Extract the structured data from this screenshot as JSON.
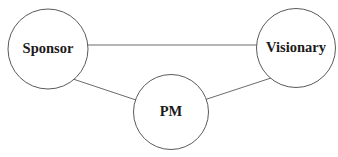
{
  "diagram": {
    "background_color": "#ffffff",
    "node_fill_color": "#ffffff",
    "node_stroke_color": "#5a5a5a",
    "edge_color": "#6b6b6b",
    "label_color": "#1a1a1a",
    "nodes": [
      {
        "id": "sponsor",
        "label": "Sponsor",
        "cx": 48,
        "cy": 49,
        "r": 40,
        "font_size": 14.5
      },
      {
        "id": "visionary",
        "label": "Visionary",
        "cx": 296,
        "cy": 48,
        "r": 39.5,
        "font_size": 14.5
      },
      {
        "id": "pm",
        "label": "PM",
        "cx": 171,
        "cy": 112,
        "r": 37.5,
        "font_size": 14.5
      }
    ],
    "edges": [
      {
        "id": "sponsor-visionary",
        "from": "sponsor",
        "to": "visionary",
        "x1": 87,
        "y1": 45,
        "x2": 257,
        "y2": 45
      },
      {
        "id": "sponsor-pm",
        "from": "sponsor",
        "to": "pm",
        "x1": 73,
        "y1": 79,
        "x2": 139,
        "y2": 101
      },
      {
        "id": "pm-visionary",
        "from": "pm",
        "to": "visionary",
        "x1": 204,
        "y1": 100,
        "x2": 271,
        "y2": 78
      }
    ]
  }
}
